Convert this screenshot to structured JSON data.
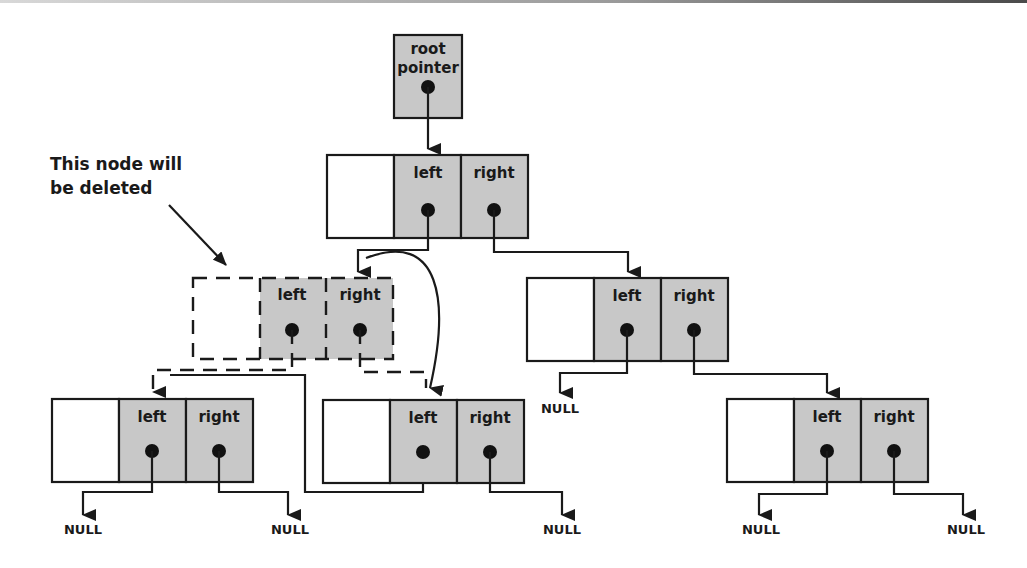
{
  "colors": {
    "pointer_cell": "#c8c8c8",
    "data_cell": "#ffffff",
    "stroke": "#1a1a1a"
  },
  "root": {
    "label_line1": "root",
    "label_line2": "pointer"
  },
  "annotation": {
    "line1": "This node will",
    "line2": "be deleted"
  },
  "nodes": {
    "top": {
      "left_label": "left",
      "right_label": "right"
    },
    "deleted": {
      "left_label": "left",
      "right_label": "right",
      "status": "to be deleted"
    },
    "mid_right": {
      "left_label": "left",
      "right_label": "right",
      "left_target": "NULL"
    },
    "bottom_left": {
      "left_label": "left",
      "right_label": "right",
      "left_target": "NULL",
      "right_target": "NULL"
    },
    "bottom_mid": {
      "left_label": "left",
      "right_label": "right",
      "right_target": "NULL"
    },
    "bottom_right": {
      "left_label": "left",
      "right_label": "right",
      "left_target": "NULL",
      "right_target": "NULL"
    }
  },
  "null_label": "NULL"
}
